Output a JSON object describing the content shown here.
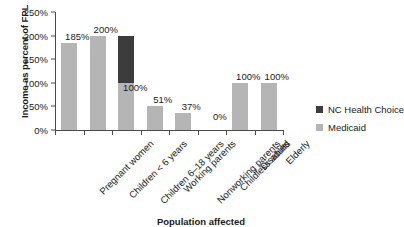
{
  "chart_data": {
    "type": "bar",
    "stacked": true,
    "title": "",
    "xlabel": "Population affected",
    "ylabel": "Income as percent of FPL",
    "categories": [
      "Pregnant women",
      "Children < 6 years",
      "Children 6–18 years",
      "Working parents",
      "Nonworking parents",
      "Childless adults",
      "Disabled",
      "Elderly"
    ],
    "series": [
      {
        "name": "Medicaid",
        "color": "#b5b5b5",
        "values": [
          185,
          200,
          100,
          51,
          37,
          0,
          100,
          100
        ]
      },
      {
        "name": "NC Health Choice",
        "color": "#3c3c3c",
        "values": [
          0,
          0,
          100,
          0,
          0,
          0,
          0,
          0
        ]
      }
    ],
    "totals": [
      185,
      200,
      200,
      51,
      37,
      0,
      100,
      100
    ],
    "bar_labels": [
      "185%",
      "200%",
      "100%",
      "51%",
      "37%",
      "0%",
      "100%",
      "100%"
    ],
    "ylim": [
      0,
      250
    ],
    "yticks": [
      0,
      50,
      100,
      150,
      200,
      250
    ],
    "ytick_labels": [
      "0%",
      "50%",
      "100%",
      "150%",
      "200%",
      "250%"
    ],
    "grid": false,
    "legend_position": "right",
    "legend": [
      {
        "label": "NC Health Choice",
        "color": "#3c3c3c"
      },
      {
        "label": "Medicaid",
        "color": "#b5b5b5"
      }
    ]
  }
}
